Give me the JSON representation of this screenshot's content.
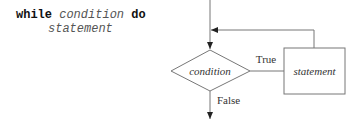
{
  "pseudocode": {
    "keyword_while": "while",
    "condition": "condition",
    "keyword_do": "do",
    "statement": "statement"
  },
  "flowchart": {
    "decision_label": "condition",
    "process_label": "statement",
    "true_label": "True",
    "false_label": "False"
  }
}
